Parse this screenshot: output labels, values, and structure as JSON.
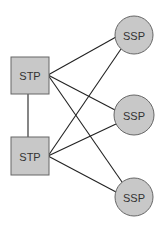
{
  "diagram": {
    "colors": {
      "node_fill": "#c8c8c8",
      "node_stroke": "#666666",
      "edge": "#222222"
    },
    "stp_nodes": [
      {
        "id": "stp1",
        "label": "STP",
        "x": 11,
        "y": 57,
        "w": 38,
        "h": 37,
        "port": [
          48,
          75
        ]
      },
      {
        "id": "stp2",
        "label": "STP",
        "x": 11,
        "y": 137,
        "w": 38,
        "h": 38,
        "port": [
          48,
          156
        ]
      }
    ],
    "ssp_nodes": [
      {
        "id": "ssp1",
        "label": "SSP",
        "cx": 134,
        "cy": 35,
        "r": 19
      },
      {
        "id": "ssp2",
        "label": "SSP",
        "cx": 134,
        "cy": 115,
        "r": 20
      },
      {
        "id": "ssp3",
        "label": "SSP",
        "cx": 134,
        "cy": 197,
        "r": 19
      }
    ]
  }
}
